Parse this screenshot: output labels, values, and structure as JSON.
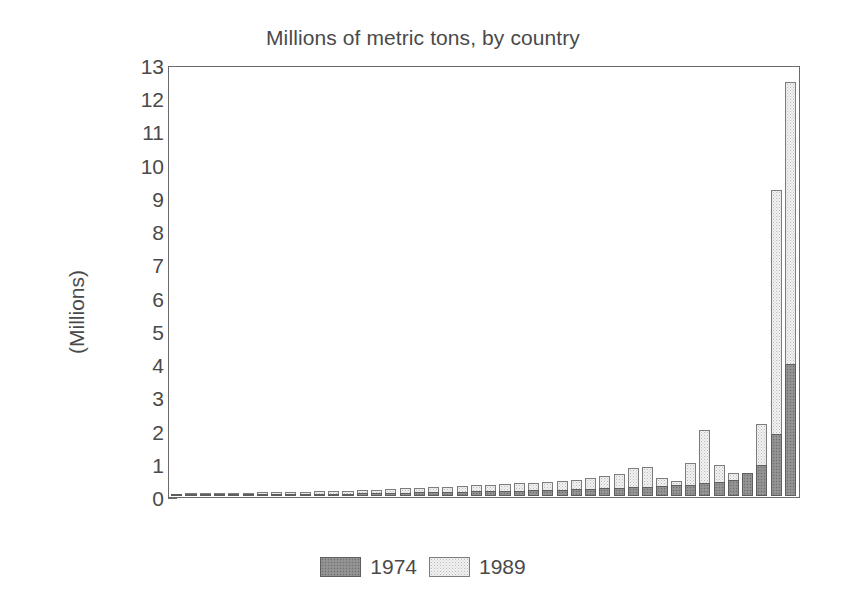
{
  "chart_data": {
    "type": "bar",
    "title": "Millions of metric tons, by country",
    "xlabel": "",
    "ylabel": "(Millions)",
    "ylim": [
      0,
      13
    ],
    "ytick_labels": [
      "13",
      "12",
      "11",
      "10",
      "9",
      "8",
      "7",
      "6",
      "5",
      "4",
      "3",
      "2",
      "1",
      "0"
    ],
    "ytick_values": [
      13,
      12,
      11,
      10,
      9,
      8,
      7,
      6,
      5,
      4,
      3,
      2,
      1,
      0
    ],
    "grid": false,
    "legend_position": "bottom-center",
    "bar_style": "overlapped",
    "categories": [
      "C1",
      "C2",
      "C3",
      "C4",
      "C5",
      "C6",
      "C7",
      "C8",
      "C9",
      "C10",
      "C11",
      "C12",
      "C13",
      "C14",
      "C15",
      "C16",
      "C17",
      "C18",
      "C19",
      "C20",
      "C21",
      "C22",
      "C23",
      "C24",
      "C25",
      "C26",
      "C27",
      "C28",
      "C29",
      "C30",
      "C31",
      "C32",
      "C33",
      "C34",
      "C35",
      "C36",
      "C37",
      "C38",
      "C39",
      "C40",
      "C41",
      "C42",
      "C43",
      "C44"
    ],
    "series": [
      {
        "name": "1974",
        "color": "#8e8e8e",
        "values": [
          0.03,
          0.04,
          0.04,
          0.05,
          0.05,
          0.06,
          0.06,
          0.07,
          0.07,
          0.07,
          0.08,
          0.08,
          0.08,
          0.09,
          0.1,
          0.1,
          0.11,
          0.12,
          0.12,
          0.13,
          0.14,
          0.15,
          0.15,
          0.16,
          0.17,
          0.18,
          0.18,
          0.2,
          0.22,
          0.22,
          0.24,
          0.26,
          0.28,
          0.3,
          0.32,
          0.34,
          0.36,
          0.4,
          0.44,
          0.5,
          0.7,
          0.95,
          1.9,
          4.0
        ]
      },
      {
        "name": "1989",
        "color": "#f2f2f2",
        "values": [
          0.08,
          0.09,
          0.09,
          0.1,
          0.1,
          0.11,
          0.12,
          0.12,
          0.13,
          0.14,
          0.15,
          0.16,
          0.17,
          0.18,
          0.2,
          0.22,
          0.24,
          0.26,
          0.28,
          0.3,
          0.32,
          0.34,
          0.36,
          0.38,
          0.4,
          0.42,
          0.44,
          0.46,
          0.5,
          0.55,
          0.62,
          0.68,
          0.85,
          0.9,
          0.55,
          0.48,
          1.0,
          2.0,
          0.95,
          0.72,
          0.62,
          2.2,
          9.3,
          12.55
        ]
      }
    ]
  },
  "legend": {
    "entries": [
      {
        "label": "1974",
        "swatch": "swatch-1974"
      },
      {
        "label": "1989",
        "swatch": "swatch-1989"
      }
    ]
  }
}
